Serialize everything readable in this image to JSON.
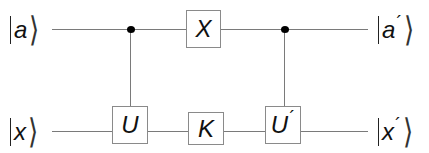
{
  "diagram": {
    "type": "quantum-circuit",
    "colors": {
      "wire": "#7a7a7a",
      "gate_border": "#8a8a8a",
      "control_dot": "#000000",
      "text": "#111111"
    },
    "inputs": [
      {
        "symbol": "a",
        "prime": "",
        "label": "|a⟩"
      },
      {
        "symbol": "x",
        "prime": "",
        "label": "|x⟩"
      }
    ],
    "outputs": [
      {
        "symbol": "a",
        "prime": "´",
        "label": "|a´⟩"
      },
      {
        "symbol": "x",
        "prime": "´",
        "label": "|x´⟩"
      }
    ],
    "gates": [
      {
        "id": "U",
        "label": "U",
        "prime": "",
        "wire": "bottom",
        "controlled_by": "top"
      },
      {
        "id": "X",
        "label": "X",
        "prime": "",
        "wire": "top",
        "controlled_by": null
      },
      {
        "id": "K",
        "label": "K",
        "prime": "",
        "wire": "bottom",
        "controlled_by": null
      },
      {
        "id": "U_prime",
        "label": "U",
        "prime": "´",
        "wire": "bottom",
        "controlled_by": "top"
      }
    ],
    "angle": "⟩"
  }
}
